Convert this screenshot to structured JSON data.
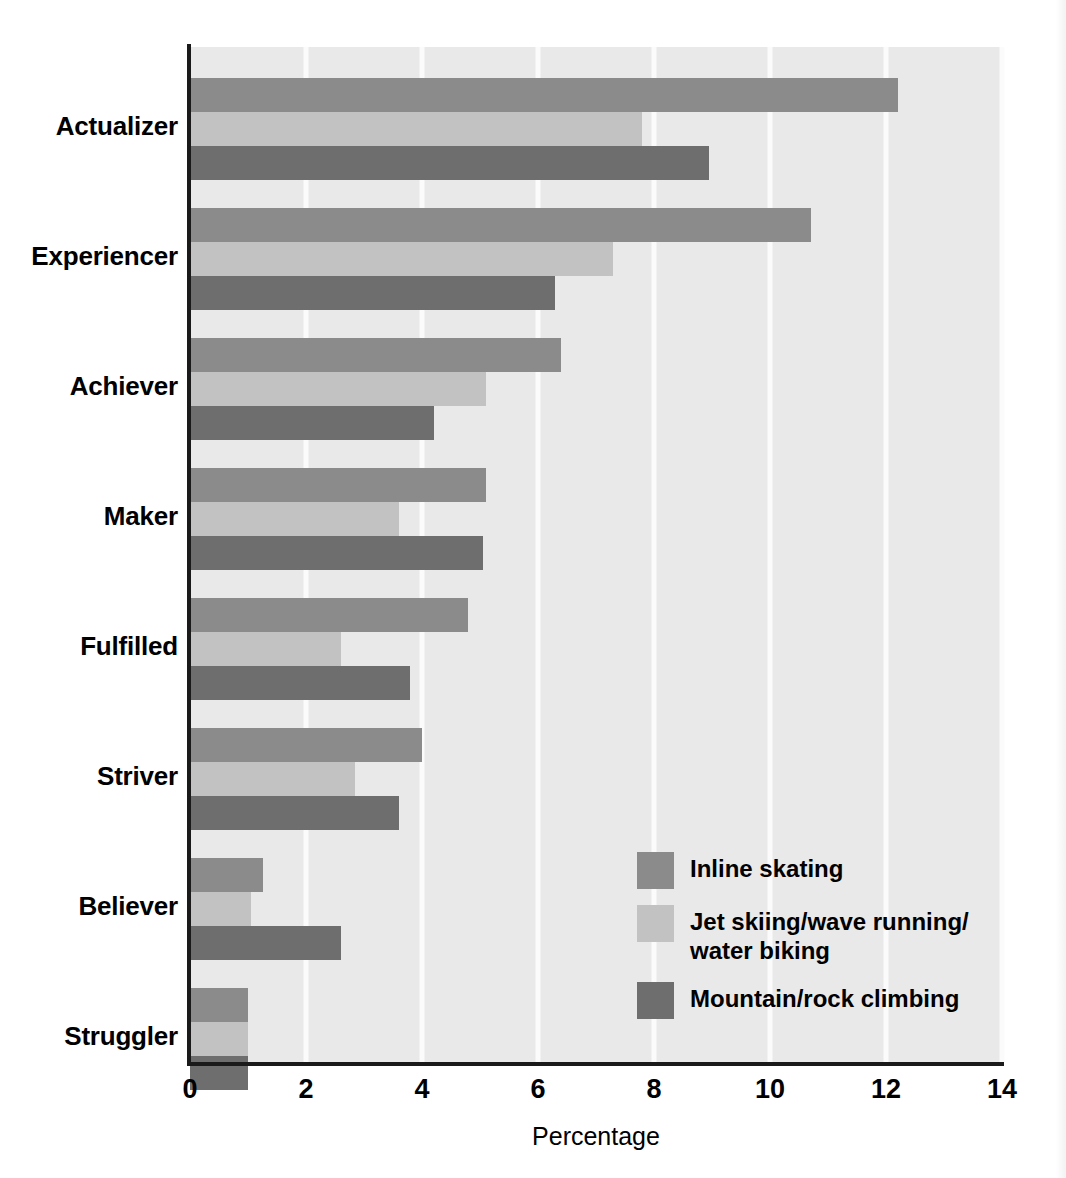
{
  "chart_data": {
    "type": "bar",
    "orientation": "horizontal",
    "title": "",
    "xlabel": "Percentage",
    "ylabel": "",
    "xlim": [
      0,
      14
    ],
    "xticks": [
      0,
      2,
      4,
      6,
      8,
      10,
      12,
      14
    ],
    "xtick_labels": [
      "0",
      "2",
      "4",
      "6",
      "8",
      "10",
      "12",
      "14"
    ],
    "grid": "vertical-white-gridlines",
    "legend_position": "inside-lower-right",
    "categories": [
      "Actualizer",
      "Experiencer",
      "Achiever",
      "Maker",
      "Fulfilled",
      "Striver",
      "Believer",
      "Struggler"
    ],
    "series": [
      {
        "name": "Inline skating",
        "color": "#8b8b8b",
        "values": [
          12.2,
          10.7,
          6.4,
          5.1,
          4.8,
          4.0,
          1.25,
          1.0
        ]
      },
      {
        "name": "Jet skiing/wave running/\nwater biking",
        "color": "#c2c2c2",
        "values": [
          7.8,
          7.3,
          5.1,
          3.6,
          2.6,
          2.85,
          1.05,
          1.0
        ]
      },
      {
        "name": "Mountain/rock climbing",
        "color": "#6e6e6e",
        "values": [
          8.95,
          6.3,
          4.2,
          5.05,
          3.8,
          3.6,
          2.6,
          1.0
        ]
      }
    ]
  },
  "legend": {
    "items": [
      {
        "label": "Inline skating",
        "color": "#8b8b8b"
      },
      {
        "label": "Jet skiing/wave running/\nwater biking",
        "color": "#c2c2c2"
      },
      {
        "label": "Mountain/rock climbing",
        "color": "#6e6e6e"
      }
    ]
  },
  "axis": {
    "x_title": "Percentage"
  }
}
